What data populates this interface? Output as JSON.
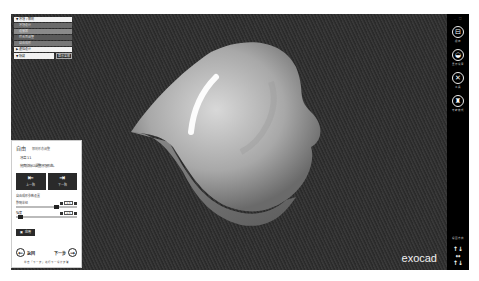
{
  "tree": {
    "header": "▼ 牙冠 / 解剖",
    "items": [
      "牙冠设计",
      "连接器",
      "咬合面调整",
      "自由成形"
    ],
    "selected": "▶ 虚拟设计",
    "search_field": "▼ 隐藏",
    "button": "显示全部"
  },
  "wizard": {
    "title": "自由",
    "subtitle": "解剖形态调整",
    "step": "牙齿 11",
    "instruction": "拖曳鼠标以调整牙冠形态。",
    "buttons": [
      {
        "icon": "⇤",
        "label": "上一颗"
      },
      {
        "icon": "⇥",
        "label": "下一颗"
      }
    ],
    "section_label": "自由成形参数设置",
    "sliders": [
      {
        "label": "影响半径",
        "value": "1.5"
      },
      {
        "label": "强度",
        "value": "0.5"
      }
    ],
    "apply_label": "应用",
    "back_label": "返回",
    "next_label": "下一步",
    "hint": "单击「下一步」进行下一设计步骤"
  },
  "toolbar": {
    "window_controls": [
      "_",
      "□"
    ],
    "tools": [
      {
        "icon": "save-icon",
        "glyph": "⊟",
        "label": "保存"
      },
      {
        "icon": "display-icon",
        "glyph": "◒",
        "label": "显示设置"
      },
      {
        "icon": "tools-icon",
        "glyph": "✕",
        "label": "工具"
      },
      {
        "icon": "expert-icon",
        "glyph": "♜",
        "label": "专家模式"
      }
    ],
    "view_label": "视图方向",
    "view_arrows": [
      "↑↓",
      "↔",
      "↑↓"
    ]
  },
  "brand": "exocad"
}
